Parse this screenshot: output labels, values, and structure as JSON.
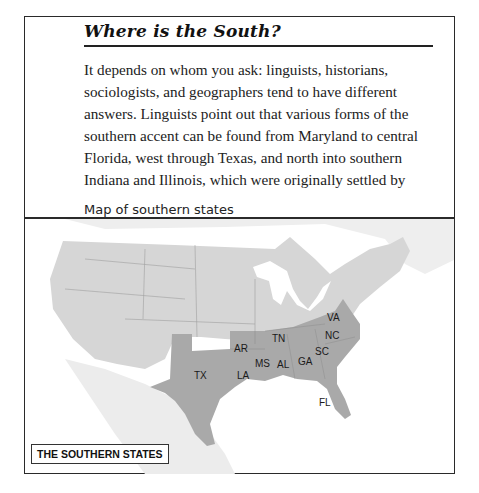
{
  "article": {
    "heading": "Where is the South?",
    "paragraph_lines": [
      "It depends on whom you ask: linguists, historians,",
      "sociologists, and geographers tend to have different",
      "answers. Linguists point out that various forms of the",
      "southern accent can be found from Maryland to central",
      "Florida, west through Texas, and north into southern",
      "Indiana and Illinois, which were originally settled by"
    ],
    "image_alt_text": "Map of southern states"
  },
  "map": {
    "legend_label": "THE SOUTHERN STATES",
    "colors": {
      "land": "#d6d6d6",
      "southern_states": "#a9a9a9",
      "water": "#ffffff",
      "border": "#2a2a2a"
    },
    "state_labels": {
      "va": "VA",
      "nc": "NC",
      "tn": "TN",
      "ar": "AR",
      "sc": "SC",
      "ms": "MS",
      "al": "AL",
      "ga": "GA",
      "tx": "TX",
      "la": "LA",
      "fl": "FL"
    }
  }
}
